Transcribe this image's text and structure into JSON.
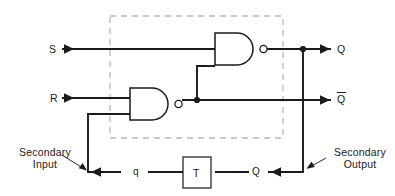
{
  "figure": {
    "type": "logic-circuit-diagram",
    "canvas": {
      "width": 395,
      "height": 196
    },
    "colors": {
      "wire": "#1a1a1a",
      "dashed_boundary": "#b9b9b9",
      "background": "#ffffff",
      "gate_fill": "#ffffff"
    }
  },
  "labels": {
    "input_s": "S",
    "input_r": "R",
    "output_q": "Q",
    "output_q_bar": "Q",
    "output_q_bar_has_overbar": true,
    "feedback_q_lower": "q",
    "feedback_Q_lower": "Q",
    "delay_block": "T",
    "annotation_secondary_input_line1": "Secondary",
    "annotation_secondary_input_line2": "Input",
    "annotation_secondary_output_line1": "Secondary",
    "annotation_secondary_output_line2": "Output"
  },
  "components": {
    "gates": [
      {
        "name": "nand-gate-top",
        "type": "NAND",
        "inputs": [
          "S",
          "feedback-from-lower-gate"
        ],
        "output": "Q",
        "x": 215,
        "y": 33,
        "w": 45,
        "h": 32
      },
      {
        "name": "nand-gate-bottom",
        "type": "NAND",
        "inputs": [
          "R",
          "secondary-input-q"
        ],
        "output": "Q-bar",
        "x": 130,
        "y": 88,
        "w": 45,
        "h": 32
      }
    ],
    "delay": {
      "name": "delay-block-T",
      "label": "T",
      "x": 183,
      "y": 157,
      "w": 28,
      "h": 31
    },
    "dashed_boundary": {
      "x": 110,
      "y": 16,
      "w": 173,
      "h": 122
    },
    "junction_dots": [
      {
        "name": "q-output-junction",
        "x": 303,
        "y": 49
      },
      {
        "name": "qbar-output-junction",
        "x": 197,
        "y": 100
      }
    ]
  },
  "nets": [
    {
      "name": "s-input-line",
      "from": "S terminal",
      "to": "nand-gate-top input 1"
    },
    {
      "name": "r-input-line",
      "from": "R terminal",
      "to": "nand-gate-bottom input 1"
    },
    {
      "name": "q-output-line",
      "from": "nand-gate-top output",
      "to": "Q terminal"
    },
    {
      "name": "qbar-output-line",
      "from": "nand-gate-bottom output",
      "to": "Q-bar terminal"
    },
    {
      "name": "cross-coupple-qbar-to-top-gate",
      "from": "qbar-output-junction",
      "to": "nand-gate-top input 2"
    },
    {
      "name": "secondary-output-path",
      "from": "q-output-junction",
      "to": "delay-block-T input"
    },
    {
      "name": "secondary-input-path",
      "from": "delay-block-T output",
      "to": "nand-gate-bottom input 2"
    }
  ]
}
